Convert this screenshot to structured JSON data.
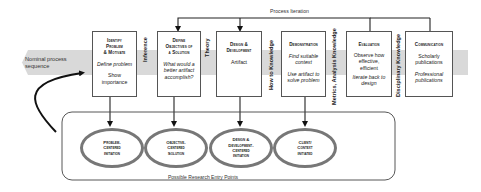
{
  "band": {
    "label_line1": "Nominal process",
    "label_line2": "sequence",
    "color": "#d9d9d9"
  },
  "iteration": {
    "label": "Process Iteration"
  },
  "activities": [
    {
      "title_lines": [
        "Identify",
        "Problem",
        "& Motivate"
      ],
      "desc1": "Define problem",
      "desc2_lines": [
        "Show",
        "importance"
      ]
    },
    {
      "title_lines": [
        "Define",
        "Objectives of",
        "a Solution"
      ],
      "desc1_lines": [
        "What would a",
        "better artifact",
        "accomplish?"
      ]
    },
    {
      "title_lines": [
        "Design &",
        "Development"
      ],
      "desc1": "Artifact"
    },
    {
      "title_lines": [
        "Demonstration"
      ],
      "desc1_lines": [
        "Find suitable",
        "context"
      ],
      "desc2_lines": [
        "Use artifact to",
        "solve problem"
      ]
    },
    {
      "title_lines": [
        "Evaluation"
      ],
      "desc1_lines": [
        "Observe how",
        "effective,",
        "efficient"
      ],
      "desc2_lines": [
        "Iterate back to",
        "design"
      ]
    },
    {
      "title_lines": [
        "Communication"
      ],
      "desc1_lines": [
        "Scholarly",
        "publications"
      ],
      "desc2_lines": [
        "Professional",
        "publications"
      ]
    }
  ],
  "connectors": {
    "inference": "Inference",
    "theory": "Theory",
    "how_to_knowledge": "How to Knowledge",
    "metrics": "Metrics, Analysis Knowledge",
    "disciplinary": "Disciplinary Knowledge"
  },
  "entry_points": {
    "caption": "Possible Research Entry Points",
    "items": [
      {
        "lines": [
          "Problem-",
          "Centered",
          "Initiation"
        ]
      },
      {
        "lines": [
          "Objective-",
          "Centered",
          "Solution"
        ]
      },
      {
        "lines": [
          "Design &",
          "Development-",
          "Centered",
          "Initiation"
        ]
      },
      {
        "lines": [
          "Client/",
          "Context",
          "Initiated"
        ]
      }
    ]
  }
}
